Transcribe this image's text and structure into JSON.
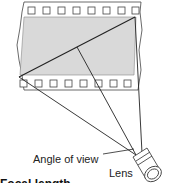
{
  "diagram": {
    "labels": {
      "angle_of_view": "Angle of view",
      "lens": "Lens",
      "cut_caption": "Focal length"
    },
    "colors": {
      "film_fill": "#d9d9d9",
      "line": "#222222",
      "background": "#ffffff"
    }
  }
}
